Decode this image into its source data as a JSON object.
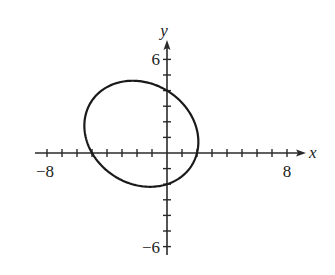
{
  "chart_data": {
    "type": "line",
    "title": "",
    "xlabel": "x",
    "ylabel": "y",
    "xlim": [
      -8.5,
      8.5
    ],
    "ylim": [
      -6.5,
      7
    ],
    "x_ticks_every": 1,
    "y_ticks_every": 1,
    "x_tick_labels": [
      {
        "value": -8,
        "text": "−8"
      },
      {
        "value": 8,
        "text": "8"
      }
    ],
    "y_tick_labels": [
      {
        "value": 6,
        "text": "6"
      },
      {
        "value": -6,
        "text": "−6"
      }
    ],
    "grid": false,
    "legend": null,
    "series": [
      {
        "name": "ellipse",
        "shape": "rotated ellipse",
        "equation": "x^2 + 0.34xy + 1.25y^2 + 3x - 2.5y - 10 = 0",
        "conic": {
          "A": 1,
          "B": 0.34,
          "C": 1.25,
          "D": 3,
          "E": -2.5,
          "F": -10
        },
        "x_intercepts": [
          -5,
          2
        ],
        "y_intercepts": [
          4,
          -2
        ],
        "approx_center": [
          -1.5,
          1.2
        ],
        "color": "#1a1a1a"
      }
    ]
  },
  "axes": {
    "x_name": "x",
    "y_name": "y",
    "x_min_label": "−8",
    "x_max_label": "8",
    "y_max_label": "6",
    "y_min_label": "−6"
  },
  "colors": {
    "axis": "#2a2a2a",
    "curve": "#1a1a1a",
    "background": "#ffffff"
  }
}
